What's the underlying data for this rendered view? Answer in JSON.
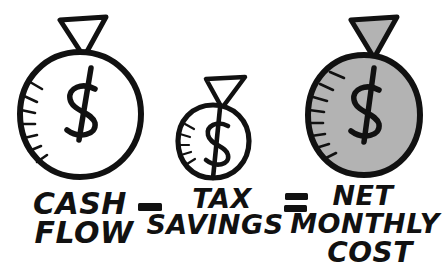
{
  "diagram": {
    "background_color": "#ffffff",
    "ink_color": "#111111",
    "fill_gray": "#b3b3b3",
    "equation_plain": "CASH FLOW - TAX SAVINGS = NET MONTHLY COST",
    "terms": [
      {
        "id": "cash-flow",
        "icon": "money-bag-icon",
        "filled": false,
        "fill_color": "#ffffff",
        "symbol": "$",
        "label_lines": [
          "CASH",
          "FLOW"
        ]
      },
      {
        "id": "tax-savings",
        "icon": "money-bag-icon",
        "filled": false,
        "fill_color": "#ffffff",
        "symbol": "$",
        "label_lines": [
          "TAX",
          "SAVINGS"
        ]
      },
      {
        "id": "net-monthly-cost",
        "icon": "money-bag-icon",
        "filled": true,
        "fill_color": "#b3b3b3",
        "symbol": "$",
        "label_lines": [
          "NET",
          "MONTHLY",
          "COST"
        ]
      }
    ],
    "operators": [
      {
        "id": "minus",
        "glyph": "-",
        "name": "minus-sign"
      },
      {
        "id": "equals",
        "glyph": "=",
        "name": "equals-sign"
      }
    ]
  }
}
